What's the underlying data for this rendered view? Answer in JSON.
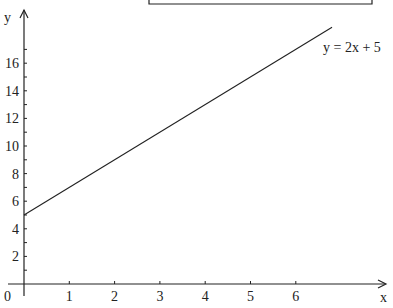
{
  "chart_data": {
    "type": "line",
    "title": "",
    "xlabel": "x",
    "ylabel": "y",
    "origin_label": "0",
    "x_ticks": [
      "1",
      "2",
      "3",
      "4",
      "5",
      "6"
    ],
    "y_ticks": [
      "2",
      "4",
      "6",
      "8",
      "10",
      "12",
      "14",
      "16"
    ],
    "xlim": [
      0,
      7
    ],
    "ylim": [
      0,
      18
    ],
    "grid": false,
    "series": [
      {
        "name": "y = 2x + 5",
        "x": [
          0,
          6.8
        ],
        "y": [
          5,
          18.6
        ]
      }
    ],
    "annotations": [
      {
        "text": "y = 2x + 5",
        "x": 6.8,
        "y": 17.5
      }
    ]
  }
}
